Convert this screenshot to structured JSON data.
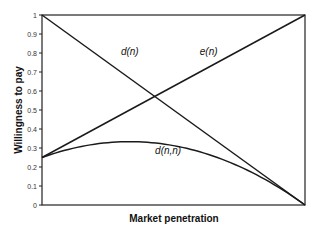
{
  "chart_data": {
    "type": "line",
    "title": "",
    "xlabel": "Market penetration",
    "ylabel": "Willingness to pay",
    "xlim": [
      0,
      1
    ],
    "ylim": [
      0,
      1
    ],
    "yticks": [
      "0",
      "0.1",
      "0.2",
      "0.3",
      "0.4",
      "0.5",
      "0.6",
      "0.7",
      "0.8",
      "0.9",
      "1"
    ],
    "xticks": [],
    "grid": false,
    "legend": "none",
    "series": [
      {
        "name": "d(n)",
        "x": [
          0,
          1
        ],
        "y": [
          1,
          0
        ]
      },
      {
        "name": "e(n)",
        "x": [
          0,
          1
        ],
        "y": [
          0.25,
          1
        ]
      },
      {
        "name": "d(n,n)",
        "x": [
          0,
          0.1,
          0.2,
          0.3,
          0.33,
          0.4,
          0.5,
          0.6,
          0.7,
          0.8,
          0.9,
          1
        ],
        "y": [
          0.25,
          0.29,
          0.32,
          0.33,
          0.33,
          0.33,
          0.31,
          0.28,
          0.23,
          0.17,
          0.09,
          0
        ]
      }
    ],
    "annotations": [
      {
        "text": "d(n)",
        "x": 0.3,
        "y": 0.79
      },
      {
        "text": "e(n)",
        "x": 0.6,
        "y": 0.79
      },
      {
        "text": "d(n,n)",
        "x": 0.43,
        "y": 0.27
      }
    ]
  }
}
